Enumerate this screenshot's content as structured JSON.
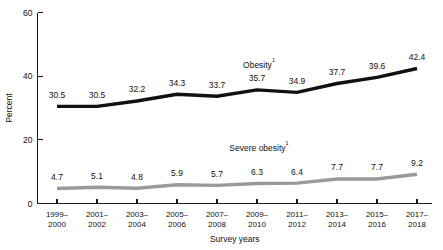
{
  "chart_data": {
    "type": "line",
    "title": "",
    "xlabel": "Survey years",
    "ylabel": "Percent",
    "categories": [
      "1999–2000",
      "2001–2002",
      "2003–2004",
      "2005–2006",
      "2007–2008",
      "2009–2010",
      "2011–2012",
      "2013–2014",
      "2015–2016",
      "2017–2018"
    ],
    "category_lines": [
      [
        "1999–",
        "2000"
      ],
      [
        "2001–",
        "2002"
      ],
      [
        "2003–",
        "2004"
      ],
      [
        "2005–",
        "2006"
      ],
      [
        "2007–",
        "2008"
      ],
      [
        "2009–",
        "2010"
      ],
      [
        "2011–",
        "2012"
      ],
      [
        "2013–",
        "2014"
      ],
      [
        "2015–",
        "2016"
      ],
      [
        "2017–",
        "2018"
      ]
    ],
    "series": [
      {
        "name": "Obesity",
        "name_superscript": "1",
        "color": "#111111",
        "stroke_width": 3.4,
        "values": [
          30.5,
          30.5,
          32.2,
          34.3,
          33.7,
          35.7,
          34.9,
          37.7,
          39.6,
          42.4
        ],
        "labels": [
          "30.5",
          "30.5",
          "32.2",
          "34.3",
          "33.7",
          "35.7",
          "34.9",
          "37.7",
          "39.6",
          "42.4"
        ]
      },
      {
        "name": "Severe obesity",
        "name_superscript": "1",
        "color": "#9a9a9a",
        "stroke_width": 3.4,
        "values": [
          4.7,
          5.1,
          4.8,
          5.9,
          5.7,
          6.3,
          6.4,
          7.7,
          7.7,
          9.2
        ],
        "labels": [
          "4.7",
          "5.1",
          "4.8",
          "5.9",
          "5.7",
          "6.3",
          "6.4",
          "7.7",
          "7.7",
          "9.2"
        ]
      }
    ],
    "yticks": [
      0,
      20,
      40,
      60
    ],
    "ytick_labels": [
      "0",
      "20",
      "40",
      "60"
    ],
    "ylim": [
      0,
      60
    ],
    "grid": false,
    "legend": "inline-annotation",
    "annotations": [
      {
        "series": "Obesity",
        "text": "Obesity",
        "superscript": "1",
        "x_index": 5.05,
        "y_value": 42.6
      },
      {
        "series": "Severe obesity",
        "text": "Severe obesity",
        "superscript": "1",
        "x_index": 5.05,
        "y_value": 16.4
      }
    ]
  },
  "axis": {
    "y_title": "Percent",
    "x_title": "Survey years"
  }
}
